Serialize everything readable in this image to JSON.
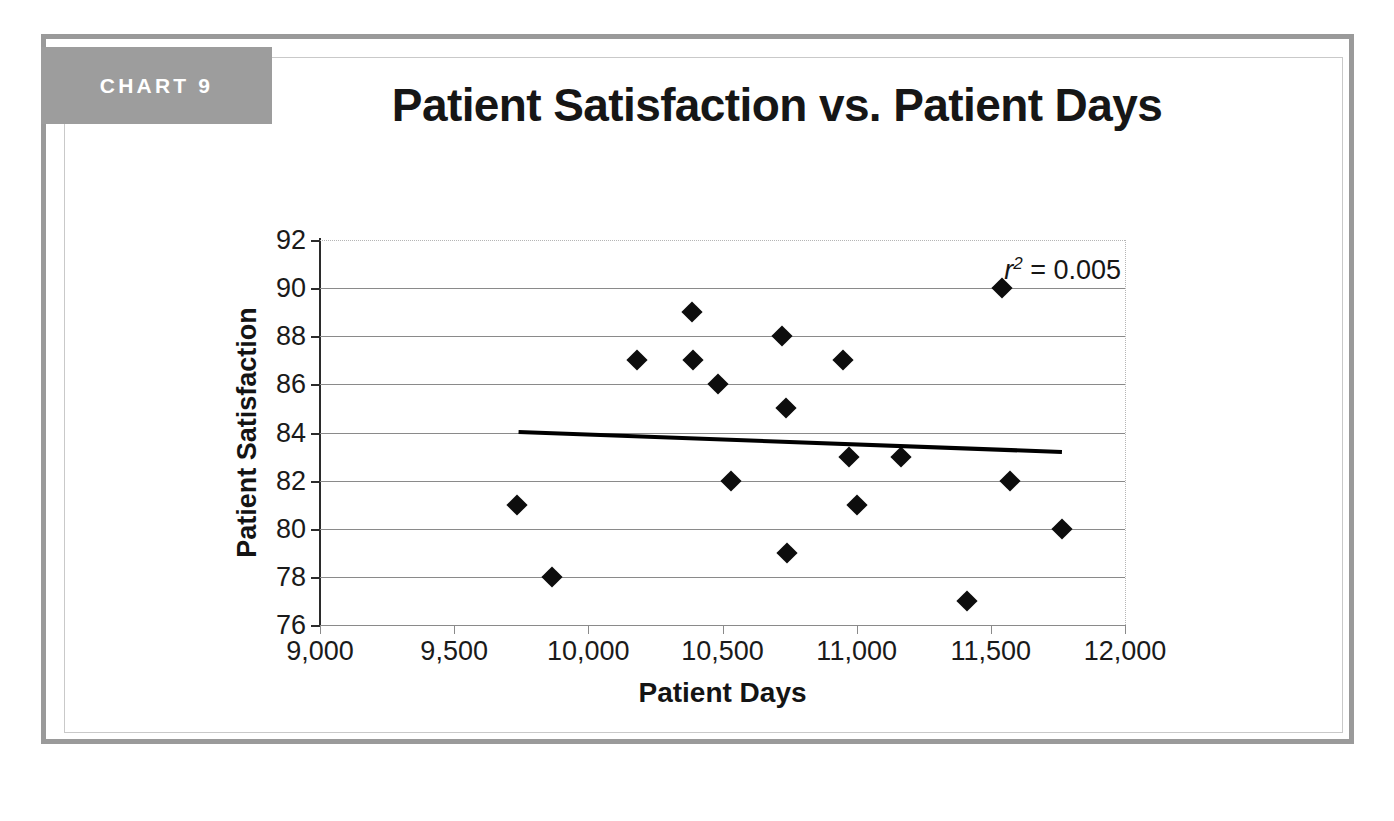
{
  "figure": {
    "badge_label": "CHART 9",
    "title": "Patient Satisfaction vs. Patient Days",
    "frame_color": "#9a9a9a",
    "badge_color": "#9d9d9d"
  },
  "chart_data": {
    "type": "scatter",
    "title": "Patient Satisfaction vs. Patient Days",
    "xlabel": "Patient Days",
    "ylabel": "Patient Satisfaction",
    "xlim": [
      9000,
      12000
    ],
    "ylim": [
      76,
      92
    ],
    "xticks": [
      9000,
      9500,
      10000,
      10500,
      11000,
      11500,
      12000
    ],
    "xtick_labels": [
      "9,000",
      "9,500",
      "10,000",
      "10,500",
      "11,000",
      "11,500",
      "12,000"
    ],
    "yticks": [
      76,
      78,
      80,
      82,
      84,
      86,
      88,
      90,
      92
    ],
    "ytick_labels": [
      "76",
      "78",
      "80",
      "82",
      "84",
      "86",
      "88",
      "90",
      "92"
    ],
    "grid": "horizontal",
    "legend": "none",
    "marker": "diamond",
    "marker_color": "#0d0d0d",
    "annotations": [
      {
        "name": "r-squared",
        "text": "r 2 = 0.005",
        "r_symbol": "r",
        "exponent": "2",
        "equals": " = 0.005",
        "value": 0.005
      }
    ],
    "points": [
      {
        "x": 9735,
        "y": 81
      },
      {
        "x": 9865,
        "y": 78
      },
      {
        "x": 10180,
        "y": 87
      },
      {
        "x": 10385,
        "y": 89
      },
      {
        "x": 10390,
        "y": 87
      },
      {
        "x": 10485,
        "y": 86
      },
      {
        "x": 10530,
        "y": 82
      },
      {
        "x": 10720,
        "y": 88
      },
      {
        "x": 10735,
        "y": 85
      },
      {
        "x": 10740,
        "y": 79
      },
      {
        "x": 10950,
        "y": 87
      },
      {
        "x": 10970,
        "y": 83
      },
      {
        "x": 11000,
        "y": 81
      },
      {
        "x": 11165,
        "y": 83
      },
      {
        "x": 11410,
        "y": 77
      },
      {
        "x": 11540,
        "y": 90
      },
      {
        "x": 11570,
        "y": 82
      },
      {
        "x": 11765,
        "y": 80
      }
    ],
    "trendline": {
      "name": "linear-trendline",
      "x_start": 9740,
      "y_start": 84.02,
      "x_end": 11765,
      "y_end": 83.19,
      "color": "#000000"
    }
  }
}
